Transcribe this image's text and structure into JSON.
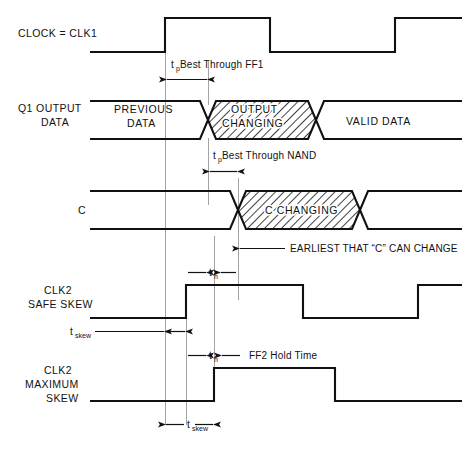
{
  "figure": {
    "type": "timing-diagram",
    "background_color": "#ffffff",
    "ink_color": "#111111",
    "reference_line_color": "#9a9a9a"
  },
  "signals": {
    "clock": {
      "label_line1": "CLOCK = CLK1",
      "label_line2": ""
    },
    "q1": {
      "label_line1": "Q1 OUTPUT",
      "label_line2": "DATA",
      "segments": [
        {
          "name": "previous",
          "line1": "PREVIOUS",
          "line2": "DATA",
          "hatched": false
        },
        {
          "name": "changing",
          "line1": "OUTPUT",
          "line2": "CHANGING",
          "hatched": true
        },
        {
          "name": "valid",
          "line1": "VALID DATA",
          "line2": "",
          "hatched": false
        }
      ]
    },
    "c": {
      "label_line1": "C",
      "label_line2": "",
      "segments": [
        {
          "name": "stable",
          "line1": "",
          "line2": "",
          "hatched": false
        },
        {
          "name": "changing",
          "line1": "C CHANGING",
          "line2": "",
          "hatched": true
        },
        {
          "name": "after",
          "line1": "",
          "line2": "",
          "hatched": false
        }
      ]
    },
    "clk2_safe": {
      "label_line1": "CLK2",
      "label_line2": "SAFE SKEW",
      "label_line3": ""
    },
    "clk2_max": {
      "label_line1": "CLK2",
      "label_line2": "MAXIMUM",
      "label_line3": "SKEW"
    }
  },
  "annotations": {
    "tp_ff1": {
      "symbol": "t",
      "subscript": "p",
      "text": " Best Through FF1"
    },
    "tp_nand": {
      "symbol": "t",
      "subscript": "p",
      "text": " Best Through NAND"
    },
    "earliest_c": {
      "text": "EARLIEST THAT “C” CAN CHANGE"
    },
    "th_top": {
      "symbol": "t",
      "subscript": "h",
      "text": ""
    },
    "tskew_safe": {
      "symbol": "t",
      "subscript": "skew",
      "text": ""
    },
    "th_hold": {
      "symbol": "t",
      "subscript": "h",
      "text": ""
    },
    "ff2_hold": {
      "text": "FF2 Hold Time"
    },
    "tskew_max": {
      "symbol": "t",
      "subscript": "skew",
      "text": ""
    }
  }
}
